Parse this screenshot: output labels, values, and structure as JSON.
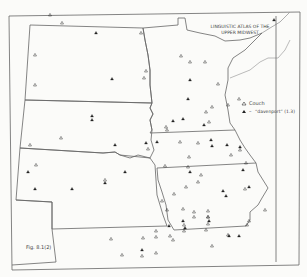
{
  "title": {
    "line1": "LINGUISTIC ATLAS OF THE",
    "line2": "UPPER MIDWEST"
  },
  "legend": {
    "items": [
      {
        "symbol": "open-triangle",
        "label": "Couch"
      },
      {
        "symbol": "filled-triangle",
        "label": "“davenport” (1.3)"
      }
    ],
    "dash": "–"
  },
  "figure_label": "Fig. 8.1(2)",
  "colors": {
    "line": "#555555",
    "paper": "#fbfbf9",
    "symbol": "#222222"
  },
  "markers": {
    "open": [
      [
        62,
        23
      ],
      [
        35,
        55
      ],
      [
        35,
        85
      ],
      [
        141,
        33
      ],
      [
        146,
        71
      ],
      [
        144,
        78
      ],
      [
        30,
        145
      ],
      [
        36,
        165
      ],
      [
        61,
        138
      ],
      [
        105,
        180
      ],
      [
        148,
        149
      ],
      [
        111,
        239
      ],
      [
        122,
        255
      ],
      [
        142,
        256
      ],
      [
        156,
        231
      ],
      [
        50,
        15
      ],
      [
        190,
        62
      ],
      [
        205,
        62
      ],
      [
        218,
        84
      ],
      [
        228,
        105
      ],
      [
        198,
        143
      ],
      [
        212,
        107
      ],
      [
        209,
        122
      ],
      [
        180,
        142
      ],
      [
        198,
        182
      ],
      [
        167,
        130
      ],
      [
        212,
        246
      ],
      [
        165,
        166
      ],
      [
        206,
        112
      ],
      [
        166,
        127
      ],
      [
        162,
        201
      ],
      [
        184,
        231
      ],
      [
        239,
        99
      ],
      [
        181,
        56
      ],
      [
        201,
        175
      ],
      [
        183,
        209
      ],
      [
        208,
        211
      ],
      [
        208,
        217
      ],
      [
        208,
        224
      ],
      [
        206,
        230
      ],
      [
        208,
        217
      ],
      [
        228,
        235
      ],
      [
        249,
        221
      ],
      [
        265,
        210
      ],
      [
        247,
        225
      ],
      [
        231,
        155
      ],
      [
        246,
        163
      ],
      [
        240,
        150
      ],
      [
        245,
        189
      ],
      [
        167,
        210
      ],
      [
        189,
        157
      ],
      [
        156,
        237
      ],
      [
        156,
        253
      ],
      [
        143,
        238
      ],
      [
        173,
        240
      ],
      [
        170,
        236
      ],
      [
        188,
        167
      ],
      [
        194,
        212
      ],
      [
        194,
        217
      ],
      [
        184,
        225
      ],
      [
        174,
        194
      ],
      [
        186,
        187
      ]
    ],
    "filled": [
      [
        96,
        33
      ],
      [
        112,
        79
      ],
      [
        92,
        116
      ],
      [
        92,
        120
      ],
      [
        115,
        145
      ],
      [
        28,
        172
      ],
      [
        125,
        172
      ],
      [
        105,
        183
      ],
      [
        35,
        189
      ],
      [
        72,
        189
      ],
      [
        142,
        250
      ],
      [
        169,
        226
      ],
      [
        223,
        191
      ],
      [
        157,
        142
      ],
      [
        274,
        20
      ],
      [
        190,
        80
      ],
      [
        188,
        99
      ],
      [
        146,
        143
      ],
      [
        173,
        121
      ],
      [
        183,
        119
      ],
      [
        204,
        125
      ],
      [
        211,
        140
      ],
      [
        212,
        146
      ],
      [
        227,
        145
      ],
      [
        226,
        196
      ],
      [
        185,
        228
      ],
      [
        240,
        147
      ],
      [
        243,
        170
      ],
      [
        209,
        221
      ],
      [
        190,
        172
      ],
      [
        229,
        236
      ],
      [
        183,
        221
      ],
      [
        239,
        236
      ],
      [
        249,
        187
      ]
    ]
  }
}
